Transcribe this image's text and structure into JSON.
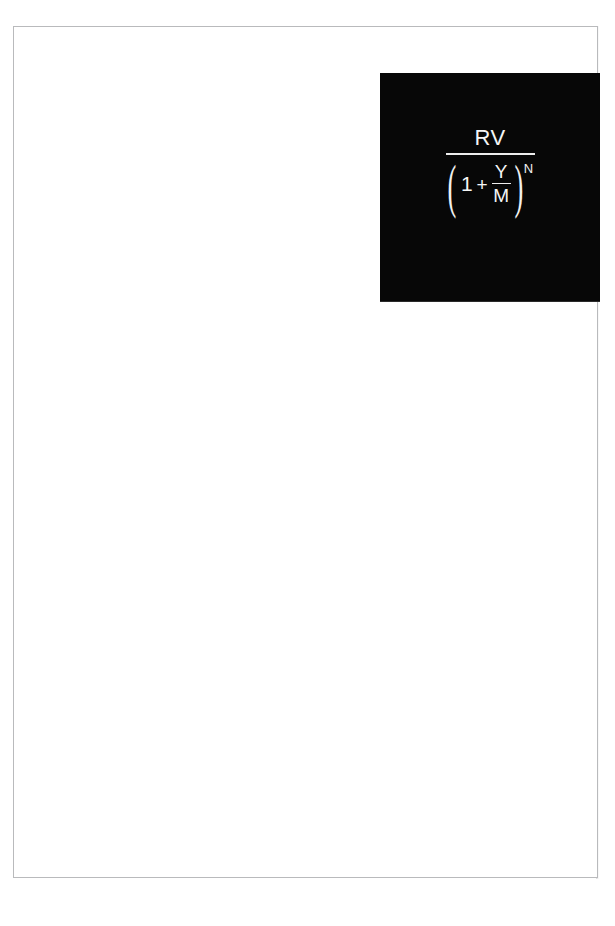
{
  "document": {
    "page_background": "#ffffff",
    "sheet_border_color": "#b9babc",
    "content_note": "blank scanned page with a single black formula panel in the upper right"
  },
  "formula_panel": {
    "background_color": "#070707",
    "text_color": "#f2f2f2",
    "expression_plain": "RV / (1 + Y/M)^N",
    "numerator": "RV",
    "denominator": {
      "paren_open": "(",
      "term_one": "1",
      "operator": "+",
      "inner_fraction": {
        "numerator": "Y",
        "denominator": "M"
      },
      "paren_close": ")",
      "exponent": "N"
    }
  }
}
